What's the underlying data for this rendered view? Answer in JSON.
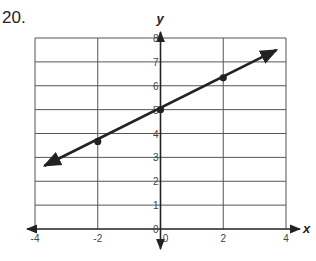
{
  "problem": {
    "number": "20."
  },
  "chart_data": {
    "type": "line",
    "title": "",
    "xlabel": "x",
    "ylabel": "y",
    "xlim": [
      -4,
      4
    ],
    "ylim": [
      0,
      8
    ],
    "grid": true,
    "x_ticks": [
      "-4",
      "-2",
      "0",
      "2",
      "4"
    ],
    "y_ticks": [
      "0",
      "1",
      "2",
      "3",
      "4",
      "5",
      "6",
      "7",
      "8"
    ],
    "series": [
      {
        "name": "line",
        "equation": "y = (2/3)x + 5",
        "points": [
          {
            "x": -2,
            "y": 3.67
          },
          {
            "x": 0,
            "y": 5
          },
          {
            "x": 2,
            "y": 6.33
          }
        ],
        "extends_both_directions": true,
        "arrow_start": {
          "x": -3.7,
          "y": 2.65
        },
        "arrow_end": {
          "x": 3.7,
          "y": 7.5
        }
      }
    ]
  }
}
